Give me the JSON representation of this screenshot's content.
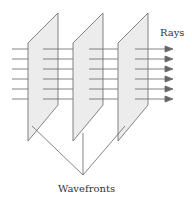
{
  "diagram": {
    "labels": {
      "rays": "Rays",
      "wavefronts": "Wavefronts"
    },
    "colors": {
      "plane_fill": "#ececec",
      "line": "#555555",
      "arrow": "#666666"
    },
    "plane_count": 3,
    "ray_count": 6
  }
}
